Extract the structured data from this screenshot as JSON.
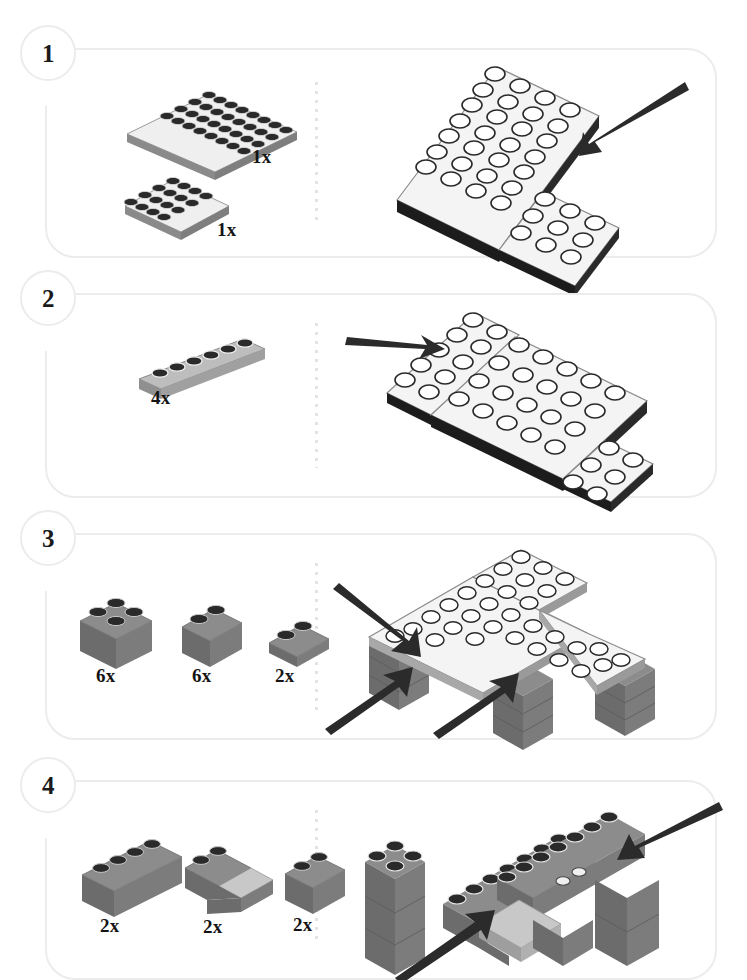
{
  "document": {
    "type": "lego-building-instructions",
    "page_background": "#ffffff",
    "panel_border_color": "#ececec",
    "divider_color": "#e3e3e3",
    "arrow_color": "#2b2b2b",
    "brick_gray_top": "#8c8c8c",
    "brick_gray_left": "#6c6c6c",
    "brick_gray_right": "#7c7c7c",
    "plate_white_top": "#f4f4f4",
    "plate_white_side": "#8a8a8a",
    "stud_dark": "#2a2a2a"
  },
  "steps": [
    {
      "number": "1",
      "parts": [
        {
          "qty": "1x",
          "shape": "plate-4x8",
          "color": "white"
        },
        {
          "qty": "1x",
          "shape": "plate-4x4",
          "color": "white"
        }
      ],
      "assembly": {
        "description": "4x8 plate joined with 4x4 plate",
        "arrows": 1
      }
    },
    {
      "number": "2",
      "parts": [
        {
          "qty": "4x",
          "shape": "plate-1x6",
          "color": "white"
        }
      ],
      "assembly": {
        "description": "Four 1x6 plates added around base plates",
        "arrows": 1
      }
    },
    {
      "number": "3",
      "parts": [
        {
          "qty": "6x",
          "shape": "brick-2x2",
          "color": "gray"
        },
        {
          "qty": "6x",
          "shape": "brick-1x2",
          "color": "gray"
        },
        {
          "qty": "2x",
          "shape": "plate-1x2",
          "color": "gray"
        }
      ],
      "assembly": {
        "description": "Gray brick legs built under the plate platform",
        "arrows": 3
      }
    },
    {
      "number": "4",
      "parts": [
        {
          "qty": "2x",
          "shape": "brick-1x4",
          "color": "gray"
        },
        {
          "qty": "2x",
          "shape": "slope-2x2",
          "color": "gray"
        },
        {
          "qty": "2x",
          "shape": "brick-1x2",
          "color": "gray"
        }
      ],
      "assembly": {
        "description": "Walls and sloped roof pieces added on top",
        "arrows": 2
      }
    }
  ]
}
